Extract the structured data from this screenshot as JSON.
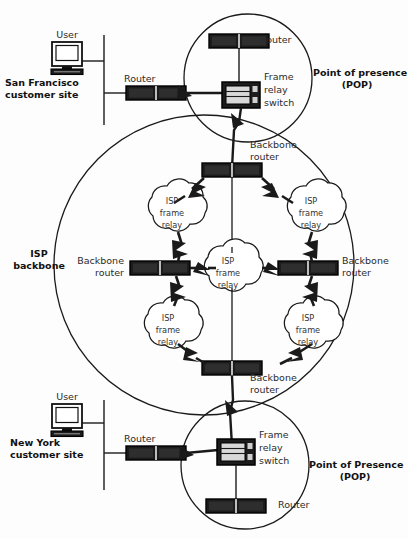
{
  "diagram": {
    "colors": {
      "line": "#1a1a1a",
      "device_fill": "#1c1c1c",
      "device_stroke": "#000000",
      "cloud_stroke": "#1a1a1a",
      "background": "#ffffff",
      "text": "#1a1a1a"
    }
  },
  "sites": [
    {
      "id": "san-francisco",
      "site_label": "San Francisco\ncustomer site",
      "user_label": "User",
      "router_label": "Router"
    },
    {
      "id": "new-york",
      "site_label": "New York\ncustomer site",
      "user_label": "User",
      "router_label": "Router"
    }
  ],
  "pops": [
    {
      "id": "pop-top",
      "label": "Point of presence\n(POP)",
      "router_label": "Router",
      "switch_label": "Frame\nrelay\nswitch"
    },
    {
      "id": "pop-bottom",
      "label": "Point of Presence\n(POP)",
      "router_label": "Router",
      "switch_label": "Frame\nrelay\nswitch"
    }
  ],
  "backbone": {
    "label": "ISP\nbackbone",
    "routers": [
      {
        "id": "bb-top",
        "label": "Backbone\nrouter"
      },
      {
        "id": "bb-left",
        "label": "Backbone\nrouter"
      },
      {
        "id": "bb-right",
        "label": "Backbone\nrouter"
      },
      {
        "id": "bb-bottom",
        "label": "Backbone\nrouter"
      }
    ],
    "clouds": [
      {
        "id": "cloud-nw",
        "label": "ISP\nframe\nrelay",
        "line1": "ISP",
        "line2": "frame",
        "line3": "relay"
      },
      {
        "id": "cloud-ne",
        "label": "ISP\nframe\nrelay",
        "line1": "ISP",
        "line2": "frame",
        "line3": "relay"
      },
      {
        "id": "cloud-center",
        "label": "ISP\nframe\nrelay",
        "line1": "ISP",
        "line2": "frame",
        "line3": "relay"
      },
      {
        "id": "cloud-sw",
        "label": "ISP\nframe\nrelay",
        "line1": "ISP",
        "line2": "frame",
        "line3": "relay"
      },
      {
        "id": "cloud-se",
        "label": "ISP\nframe\nrelay",
        "line1": "ISP",
        "line2": "frame",
        "line3": "relay"
      }
    ]
  },
  "labels": {
    "sf_site_line1": "San Francisco",
    "sf_site_line2": "customer site",
    "sf_user": "User",
    "sf_router": "Router",
    "pop_top_line1": "Point of presence",
    "pop_top_line2": "(POP)",
    "pop_top_router": "Router",
    "pop_top_switch_line1": "Frame",
    "pop_top_switch_line2": "relay",
    "pop_top_switch_line3": "switch",
    "bb_top_line1": "Backbone",
    "bb_top_line2": "router",
    "bb_left_line1": "Backbone",
    "bb_left_line2": "router",
    "bb_right_line1": "Backbone",
    "bb_right_line2": "router",
    "bb_bottom_line1": "Backbone",
    "bb_bottom_line2": "router",
    "isp_backbone_line1": "ISP",
    "isp_backbone_line2": "backbone",
    "ny_site_line1": "New York",
    "ny_site_line2": "customer site",
    "ny_user": "User",
    "ny_router": "Router",
    "pop_bot_line1": "Point of Presence",
    "pop_bot_line2": "(POP)",
    "pop_bot_router": "Router",
    "pop_bot_switch_line1": "Frame",
    "pop_bot_switch_line2": "relay",
    "pop_bot_switch_line3": "switch",
    "cloud_nw_1": "ISP",
    "cloud_nw_2": "frame",
    "cloud_nw_3": "relay",
    "cloud_ne_1": "ISP",
    "cloud_ne_2": "frame",
    "cloud_ne_3": "relay",
    "cloud_c_1": "ISP",
    "cloud_c_2": "frame",
    "cloud_c_3": "relay",
    "cloud_sw_1": "ISP",
    "cloud_sw_2": "frame",
    "cloud_sw_3": "relay",
    "cloud_se_1": "ISP",
    "cloud_se_2": "frame",
    "cloud_se_3": "relay"
  }
}
